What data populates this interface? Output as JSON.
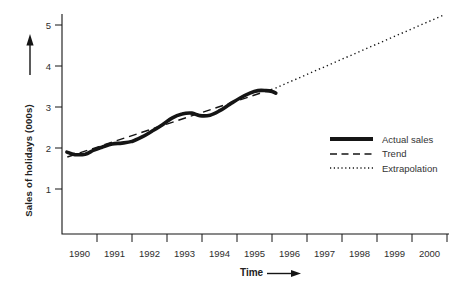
{
  "figure": {
    "background": "#ffffff",
    "ink": "#151515",
    "text_color": "#2e2e2e"
  },
  "chart_data": {
    "type": "line",
    "title": "",
    "xlabel": "Time",
    "ylabel": "Sales of holidays (000s)",
    "x_tick_labels": [
      "1990",
      "1991",
      "1992",
      "1993",
      "1994",
      "1995",
      "1996",
      "1997",
      "1998",
      "1999",
      "2000"
    ],
    "y_ticks": [
      1,
      2,
      3,
      4,
      5
    ],
    "xlim": [
      1990,
      2001.1
    ],
    "ylim": [
      0,
      5.4
    ],
    "grid": false,
    "legend_position": "right-middle",
    "series": [
      {
        "name": "Actual sales",
        "style": "solid",
        "points": [
          [
            1990.14,
            1.9
          ],
          [
            1990.37,
            1.84
          ],
          [
            1990.66,
            1.85
          ],
          [
            1990.91,
            1.95
          ],
          [
            1991.14,
            2.02
          ],
          [
            1991.43,
            2.1
          ],
          [
            1991.71,
            2.12
          ],
          [
            1992.0,
            2.16
          ],
          [
            1992.29,
            2.27
          ],
          [
            1992.57,
            2.41
          ],
          [
            1992.86,
            2.56
          ],
          [
            1993.14,
            2.73
          ],
          [
            1993.43,
            2.83
          ],
          [
            1993.71,
            2.85
          ],
          [
            1993.94,
            2.79
          ],
          [
            1994.23,
            2.8
          ],
          [
            1994.51,
            2.91
          ],
          [
            1994.8,
            3.07
          ],
          [
            1995.09,
            3.22
          ],
          [
            1995.37,
            3.34
          ],
          [
            1995.6,
            3.4
          ],
          [
            1995.83,
            3.4
          ],
          [
            1996.0,
            3.38
          ],
          [
            1996.11,
            3.34
          ]
        ]
      },
      {
        "name": "Trend",
        "style": "dashed",
        "points": [
          [
            1990.15,
            1.78
          ],
          [
            1996.1,
            3.46
          ]
        ]
      },
      {
        "name": "Extrapolation",
        "style": "dotted",
        "points": [
          [
            1996.1,
            3.46
          ],
          [
            2000.92,
            5.25
          ]
        ]
      }
    ]
  }
}
